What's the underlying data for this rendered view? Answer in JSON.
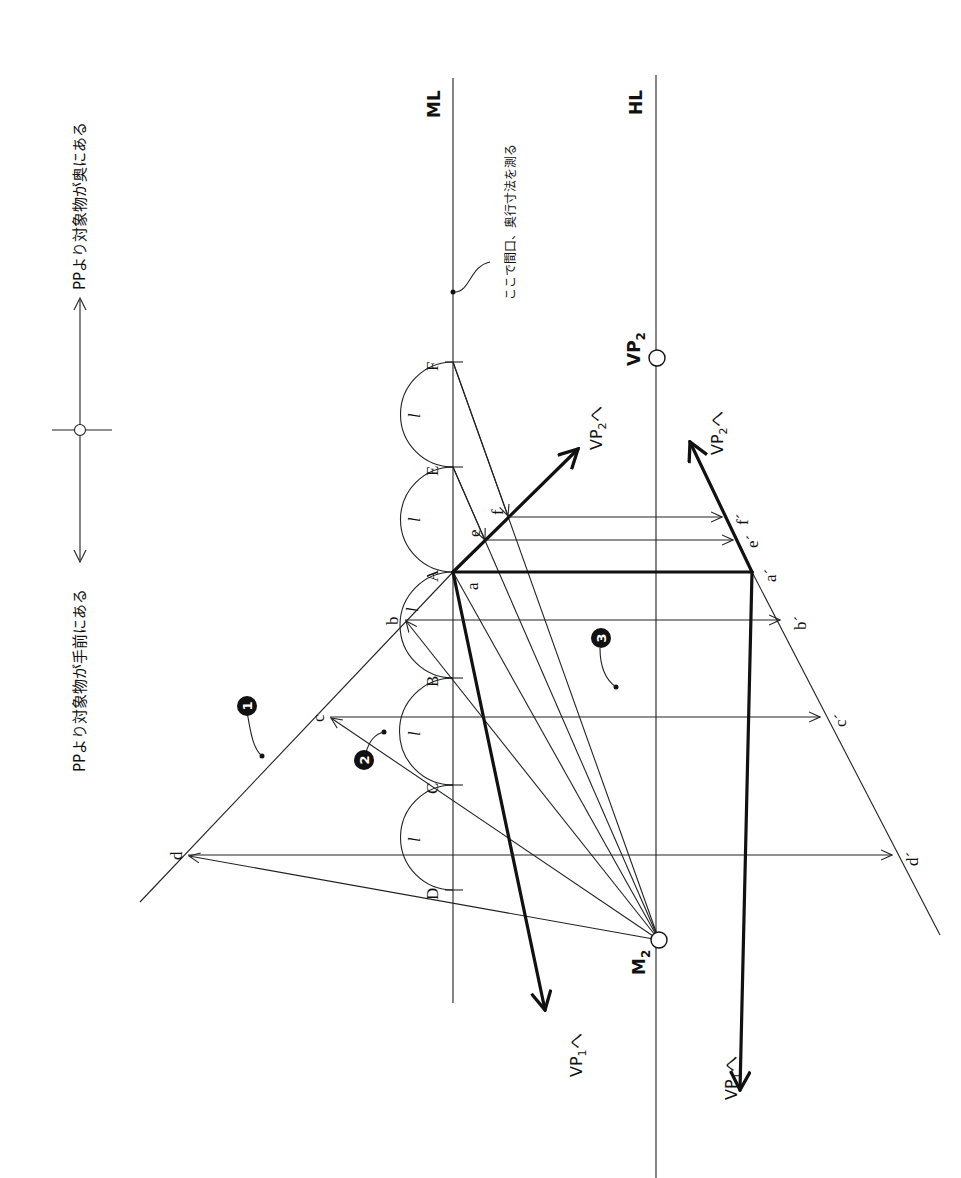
{
  "diagram": {
    "type": "perspective measuring-point construction (rotated 90°)",
    "legend": {
      "left_text": "PPより対象物が手前にある",
      "right_text": "PPより対象物が奥にある"
    },
    "lines": {
      "ml_label": "ML",
      "hl_label": "HL"
    },
    "annotation_measure": "ここで間口、奥行寸法を測る",
    "points_on_ml": [
      "F",
      "E",
      "A",
      "B",
      "C",
      "D"
    ],
    "segment_label": "l",
    "plan_points": {
      "a": "a",
      "b": "b",
      "c": "c",
      "d": "d",
      "e": "e",
      "f": "f"
    },
    "projected_points": {
      "a": "a´",
      "b": "b´",
      "c": "c´",
      "d": "d´",
      "e": "e´",
      "f": "f´"
    },
    "vanishing": {
      "vp2": "VP",
      "vp2_sub": "2",
      "m2": "M",
      "m2_sub": "2",
      "to_vp1": "VP",
      "to_vp1_sub": "1",
      "to_vp2": "VP",
      "to_vp2_sub": "2",
      "direction_suffix": "へ"
    },
    "badges": [
      "1",
      "2",
      "3"
    ]
  }
}
